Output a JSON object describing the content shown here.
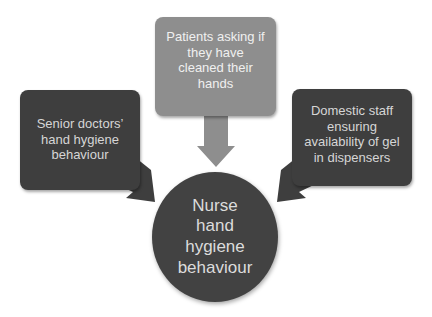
{
  "diagram": {
    "type": "converging-influences",
    "center": {
      "label": "Nurse hand hygiene behaviour",
      "lines": [
        "Nurse",
        "hand",
        "hygiene",
        "behaviour"
      ],
      "shape": "circle",
      "color": "#424242"
    },
    "influences": [
      {
        "id": "top",
        "label": "Patients asking if they have cleaned their hands",
        "lines": [
          "Patients asking if",
          "they have",
          "cleaned their",
          "hands"
        ],
        "position": "top",
        "color": "#8e8e8e"
      },
      {
        "id": "left",
        "label": "Senior doctors' hand hygiene behaviour",
        "lines": [
          "Senior doctors’",
          "hand hygiene",
          "behaviour"
        ],
        "position": "left",
        "color": "#3e3e3e"
      },
      {
        "id": "right",
        "label": "Domestic staff ensuring availability of gel in dispensers",
        "lines": [
          "Domestic staff",
          "ensuring",
          "availability of gel",
          "in dispensers"
        ],
        "position": "right",
        "color": "#3e3e3e"
      }
    ],
    "edges": [
      {
        "from": "top",
        "to": "center"
      },
      {
        "from": "left",
        "to": "center"
      },
      {
        "from": "right",
        "to": "center"
      }
    ]
  }
}
